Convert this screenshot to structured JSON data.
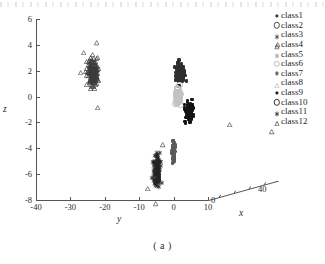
{
  "figure": {
    "caption": "( a )",
    "type": "3d-scatter"
  },
  "chart_data": {
    "type": "scatter",
    "title": "",
    "projection": "3d",
    "xlabel": "x",
    "ylabel": "y",
    "zlabel": "z",
    "xlim": [
      0,
      40
    ],
    "ylim": [
      -40,
      10
    ],
    "zlim": [
      -8,
      6
    ],
    "grid": false,
    "legend_position": "right",
    "x_ticks": [
      0,
      10,
      20,
      30,
      40
    ],
    "x_tick_labels": [
      "0",
      "40"
    ],
    "y_ticks": [
      -40,
      -30,
      -20,
      -10,
      0,
      10
    ],
    "y_tick_labels": [
      "-40",
      "-30",
      "-20",
      "-10",
      "0",
      "10"
    ],
    "z_ticks": [
      6,
      4,
      2,
      0,
      -2,
      -4,
      -6,
      -8
    ],
    "z_tick_labels": [
      "6",
      "4",
      "2",
      "0",
      "-2",
      "-4",
      "-6",
      "-8"
    ],
    "legend": [
      {
        "label": "class1",
        "marker": "square-filled",
        "color": "#3a3a3a"
      },
      {
        "label": "class2",
        "marker": "circle-open",
        "color": "#4a4a4a"
      },
      {
        "label": "class3",
        "marker": "asterisk",
        "color": "#3f3f3f"
      },
      {
        "label": "class4",
        "marker": "triangle-open",
        "color": "#454545"
      },
      {
        "label": "class5",
        "marker": "asterisk",
        "color": "#9a9a9a"
      },
      {
        "label": "class6",
        "marker": "circle-open",
        "color": "#bdbdbd"
      },
      {
        "label": "class7",
        "marker": "square-filled",
        "color": "#6a6a6a"
      },
      {
        "label": "class8",
        "marker": "triangle-open",
        "color": "#b0b0b0"
      },
      {
        "label": "class9",
        "marker": "square-filled",
        "color": "#202020"
      },
      {
        "label": "class10",
        "marker": "circle-open",
        "color": "#2e2e2e"
      },
      {
        "label": "class11",
        "marker": "asterisk",
        "color": "#2a2a2a"
      },
      {
        "label": "class12",
        "marker": "triangle-open",
        "color": "#303030"
      }
    ],
    "clusters": [
      {
        "name": "left-cluster",
        "legend": "class12",
        "marker": "triangle-open",
        "color": "#3c3c3c",
        "center_y": -23.5,
        "center_z": 2.6,
        "spread_y": 2.0,
        "spread_z": 1.3,
        "count": 150
      },
      {
        "name": "center-upper-blob",
        "legend": "class1",
        "marker": "square-filled",
        "color": "#2f2f2f",
        "center_y": 2.0,
        "center_z": 1.8,
        "spread_y": 1.6,
        "spread_z": 0.9,
        "count": 120
      },
      {
        "name": "center-light-circles",
        "legend": "class6",
        "marker": "circle-open",
        "color": "#c2c2c2",
        "center_y": 1.0,
        "center_z": 0.1,
        "spread_y": 1.0,
        "spread_z": 0.9,
        "count": 60
      },
      {
        "name": "center-lower-blob",
        "legend": "class9",
        "marker": "square-filled",
        "color": "#141414",
        "center_y": 4.5,
        "center_z": -1.2,
        "spread_y": 1.3,
        "spread_z": 0.8,
        "count": 130
      },
      {
        "name": "right-cluster",
        "legend": "class8",
        "marker": "triangle-open",
        "color": "#b4b4b4",
        "center_y": 26.0,
        "center_z": 1.1,
        "spread_y": 2.2,
        "spread_z": 1.7,
        "count": 170
      },
      {
        "name": "bottom-asterisks",
        "legend": "class11",
        "marker": "asterisk",
        "color": "#252525",
        "center_y": -5.0,
        "center_z": -5.0,
        "spread_y": 1.3,
        "spread_z": 1.5,
        "count": 110
      },
      {
        "name": "bottom-bar",
        "legend": "class7",
        "marker": "square-filled",
        "color": "#5a5a5a",
        "center_y": 0.0,
        "center_z": -4.4,
        "spread_y": 0.5,
        "spread_z": 1.0,
        "count": 70
      }
    ]
  }
}
